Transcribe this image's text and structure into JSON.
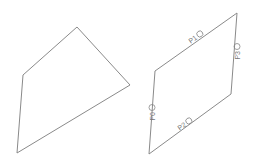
{
  "canvas": {
    "width": 259,
    "height": 167,
    "background": "#ffffff",
    "stroke_color": "#8a8a8a"
  },
  "shapes": {
    "quadrilateral": {
      "points": "77,27 130,85 17,153 23,75"
    },
    "parallelogram": {
      "points": "237,13 231,94 149,154 155,71"
    }
  },
  "labels": [
    {
      "id": "p0",
      "text": "P0",
      "x": 152,
      "y": 111,
      "angle": -90
    },
    {
      "id": "p1",
      "text": "P1",
      "x": 197,
      "y": 36,
      "angle": -36
    },
    {
      "id": "p2",
      "text": "P2",
      "x": 186,
      "y": 123,
      "angle": -36
    },
    {
      "id": "p3",
      "text": "P3",
      "x": 237,
      "y": 50,
      "angle": -90
    }
  ]
}
